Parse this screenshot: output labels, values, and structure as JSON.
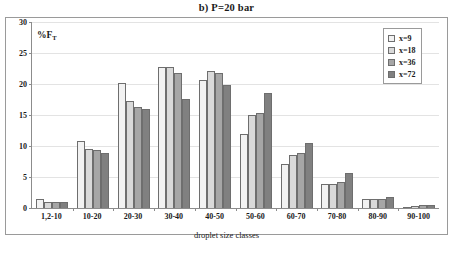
{
  "chart_data": {
    "type": "bar",
    "title": "b) P=20 bar",
    "xlabel": "droplet size classes",
    "ylabel": "%F",
    "ylabel_sub": "T",
    "ylim": [
      0,
      30
    ],
    "yticks": [
      0,
      5,
      10,
      15,
      20,
      25,
      30
    ],
    "grid": true,
    "legend_position": "top-right",
    "categories": [
      "1,2-10",
      "10-20",
      "20-30",
      "30-40",
      "40-50",
      "50-60",
      "60-70",
      "70-80",
      "80-90",
      "90-100"
    ],
    "series": [
      {
        "name": "x=9",
        "color": "#f2f2f2",
        "values": [
          1.5,
          10.8,
          20.1,
          22.7,
          20.6,
          12.0,
          7.1,
          3.8,
          1.5,
          0.1
        ]
      },
      {
        "name": "x=18",
        "color": "#d9d9d9",
        "values": [
          0.9,
          9.5,
          17.2,
          22.7,
          22.1,
          15.0,
          8.5,
          3.9,
          1.4,
          0.3
        ]
      },
      {
        "name": "x=36",
        "color": "#a6a6a6",
        "values": [
          0.9,
          9.4,
          16.3,
          21.7,
          21.7,
          15.3,
          8.8,
          4.2,
          1.5,
          0.5
        ]
      },
      {
        "name": "x=72",
        "color": "#808080",
        "values": [
          0.9,
          8.9,
          15.9,
          17.6,
          19.8,
          18.5,
          10.5,
          5.6,
          1.8,
          0.5
        ]
      }
    ]
  },
  "colors": {
    "axis": "#8c8c8c",
    "frame": "#9a9a9a",
    "grid": "#e3e3e3",
    "bar_border": "#6e6e6e",
    "text": "#1a1a1a",
    "background": "#ffffff"
  }
}
